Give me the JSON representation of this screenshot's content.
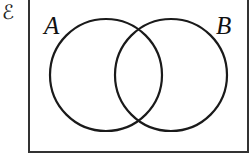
{
  "diagram": {
    "type": "venn",
    "universal_set": {
      "symbol": "ℰ"
    },
    "sets": [
      {
        "label": "A",
        "cx": 106,
        "cy": 75,
        "r": 56
      },
      {
        "label": "B",
        "cx": 171,
        "cy": 75,
        "r": 56
      }
    ],
    "colors": {
      "stroke": "#1a1a1a",
      "background": "#ffffff",
      "frame": "#333333"
    }
  }
}
